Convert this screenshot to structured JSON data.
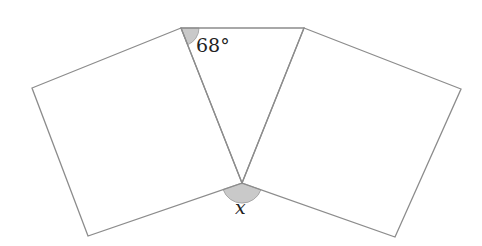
{
  "diagram": {
    "points": {
      "triangle_top_left": [
        181,
        28
      ],
      "triangle_top_right": [
        304,
        28
      ],
      "triangle_bottom": [
        242,
        183
      ],
      "left_square_outer_top": [
        32,
        88
      ],
      "left_square_outer_bottom": [
        88,
        236
      ],
      "right_square_outer_top": [
        461,
        89
      ],
      "right_square_outer_bottom": [
        395,
        237
      ]
    },
    "shapes": [
      {
        "name": "triangle",
        "vertices": [
          "triangle_top_left",
          "triangle_top_right",
          "triangle_bottom"
        ]
      },
      {
        "name": "left-square",
        "vertices": [
          "triangle_top_left",
          "left_square_outer_top",
          "left_square_outer_bottom",
          "triangle_bottom"
        ]
      },
      {
        "name": "right-square",
        "vertices": [
          "triangle_top_right",
          "right_square_outer_top",
          "right_square_outer_bottom",
          "triangle_bottom"
        ]
      }
    ],
    "angles": [
      {
        "name": "given-angle",
        "label": "68°",
        "at": "triangle_top_left"
      },
      {
        "name": "unknown-angle",
        "label": "x",
        "at": "triangle_bottom"
      }
    ],
    "colors": {
      "line": "#8c8c8c",
      "angle_shading": "#c9c9c9",
      "text": "#222222"
    }
  }
}
